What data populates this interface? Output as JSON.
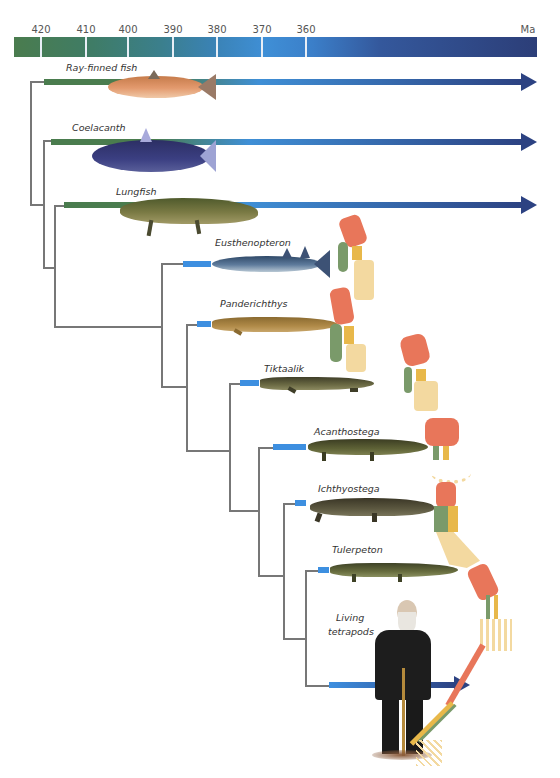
{
  "timeline": {
    "unit": "Ma",
    "ticks": [
      {
        "label": "420",
        "x": 41
      },
      {
        "label": "410",
        "x": 86
      },
      {
        "label": "400",
        "x": 128
      },
      {
        "label": "390",
        "x": 173
      },
      {
        "label": "380",
        "x": 217
      },
      {
        "label": "370",
        "x": 262
      },
      {
        "label": "360",
        "x": 306
      }
    ],
    "colors": {
      "start": "#4a7c4e",
      "mid": "#3f8fd6",
      "end": "#2c3e78"
    }
  },
  "taxa": [
    {
      "name": "Ray-finned fish",
      "type": "living",
      "color": "#d9855a"
    },
    {
      "name": "Coelacanth",
      "type": "living",
      "color": "#3a3f7a"
    },
    {
      "name": "Lungfish",
      "type": "living",
      "color": "#6e6a3c"
    },
    {
      "name": "Eusthenopteron",
      "type": "fossil",
      "color": "#4a6585"
    },
    {
      "name": "Panderichthys",
      "type": "fossil",
      "color": "#a98444"
    },
    {
      "name": "Tiktaalik",
      "type": "fossil",
      "color": "#5c5738"
    },
    {
      "name": "Acanthostega",
      "type": "fossil",
      "color": "#545a30"
    },
    {
      "name": "Ichthyostega",
      "type": "fossil",
      "color": "#4e4a34"
    },
    {
      "name": "Tulerpeton",
      "type": "fossil",
      "color": "#5a5e34"
    },
    {
      "name": "Living tetrapods",
      "line1": "Living",
      "line2": "tetrapods",
      "type": "living",
      "color": "#2a2a2a"
    }
  ],
  "limb_bone_colors": {
    "humerus": "#e8765a",
    "ulna": "#7a9a6a",
    "radius": "#e8b84a",
    "digits": "#f3d9a0"
  },
  "tree_color": "#777777",
  "fossil_range_color": "#3d8fe0"
}
